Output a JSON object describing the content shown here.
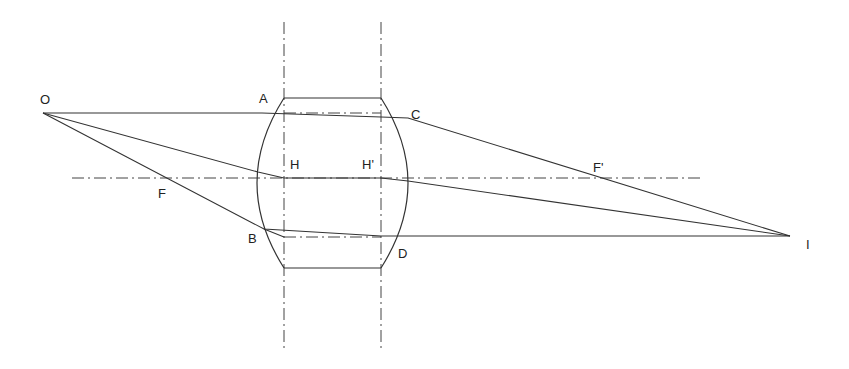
{
  "diagram": {
    "labels": {
      "object": "O",
      "image": "I",
      "front_focal": "F",
      "back_focal": "F'",
      "front_principal": "H",
      "back_principal": "H'",
      "point_a": "A",
      "point_b": "B",
      "point_c": "C",
      "point_d": "D"
    },
    "points": {
      "O": [
        43,
        113
      ],
      "I": [
        790,
        236
      ],
      "F": [
        168,
        178
      ],
      "F_prime": [
        596,
        178
      ],
      "H": [
        284,
        178
      ],
      "H_prime": [
        381,
        178
      ],
      "A": [
        284,
        98
      ],
      "B": [
        256,
        228
      ],
      "C": [
        408,
        116
      ],
      "D": [
        381,
        237
      ]
    },
    "optical_axis_y": 178,
    "principal_planes_x": [
      284,
      381
    ],
    "lens": {
      "top_y": 98,
      "bottom_y": 268,
      "left_x": 284,
      "right_x": 381,
      "left_bulge_x": 257,
      "right_bulge_x": 408
    },
    "colors": {
      "line": "#333333",
      "background": "#ffffff"
    }
  }
}
